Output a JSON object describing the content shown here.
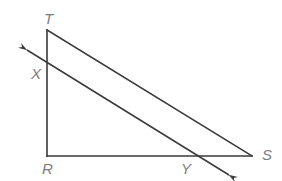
{
  "figure": {
    "canvas": {
      "width": 282,
      "height": 181
    },
    "colors": {
      "background": "#ffffff",
      "stroke": "#3a3a3a",
      "label": "#7d7d7d"
    },
    "stroke_width": 1.6,
    "points": {
      "T": {
        "x": 47,
        "y": 30
      },
      "R": {
        "x": 47,
        "y": 156
      },
      "S": {
        "x": 252,
        "y": 156
      },
      "X": {
        "x": 47,
        "y": 63
      },
      "Y": {
        "x": 196,
        "y": 156
      }
    },
    "segments": [
      {
        "name": "segment-TR",
        "from": "T",
        "to": "R",
        "path": "M 47 30 L 47 156"
      },
      {
        "name": "segment-RS",
        "from": "R",
        "to": "S",
        "path": "M 47 156 L 252 156"
      },
      {
        "name": "segment-TS",
        "from": "T",
        "to": "S",
        "path": "M 47 30 L 252 156"
      }
    ],
    "ray": {
      "name": "ray-XY",
      "path": "M 27 50 L 229 175",
      "arrow_start": {
        "tip_x": 22,
        "tip_y": 46
      },
      "arrow_end": {
        "tip_x": 234,
        "tip_y": 178
      }
    },
    "labels": [
      {
        "id": "label-T",
        "text": "T",
        "x": 44,
        "y": 24
      },
      {
        "id": "label-X",
        "text": "X",
        "x": 31,
        "y": 79
      },
      {
        "id": "label-R",
        "text": "R",
        "x": 42,
        "y": 174
      },
      {
        "id": "label-Y",
        "text": "Y",
        "x": 181,
        "y": 174
      },
      {
        "id": "label-S",
        "text": "S",
        "x": 262,
        "y": 160
      }
    ]
  }
}
